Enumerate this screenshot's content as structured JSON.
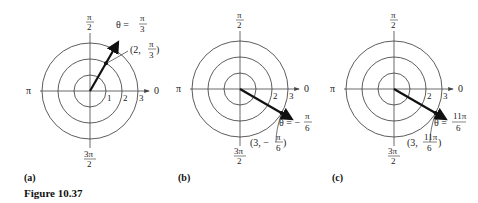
{
  "figure": {
    "title": "Figure 10.37"
  },
  "axis_labels": {
    "zero": "0",
    "half_pi_num": "π",
    "half_pi_den": "2",
    "pi": "π",
    "three_half_pi_num": "3π",
    "three_half_pi_den": "2"
  },
  "ring_labels": [
    "1",
    "2",
    "3"
  ],
  "panels": [
    {
      "caption": "(a)",
      "theta_label_prefix": "θ =",
      "theta_num": "π",
      "theta_den": "3",
      "point_label_left": "(2,",
      "point_num": "π",
      "point_den": "3",
      "point_label_right": ")",
      "r": 2,
      "angle_deg": 60
    },
    {
      "caption": "(b)",
      "theta_label_prefix": "θ = −",
      "theta_num": "π",
      "theta_den": "6",
      "point_label_left": "(3, −",
      "point_num": "π",
      "point_den": "6",
      "point_label_right": ")",
      "r": 3,
      "angle_deg": -30
    },
    {
      "caption": "(c)",
      "theta_label_prefix": "θ =",
      "theta_num": "11π",
      "theta_den": "6",
      "point_label_left": "(3,",
      "point_num": "11π",
      "point_den": "6",
      "point_label_right": ")",
      "r": 3,
      "angle_deg": 330
    }
  ]
}
